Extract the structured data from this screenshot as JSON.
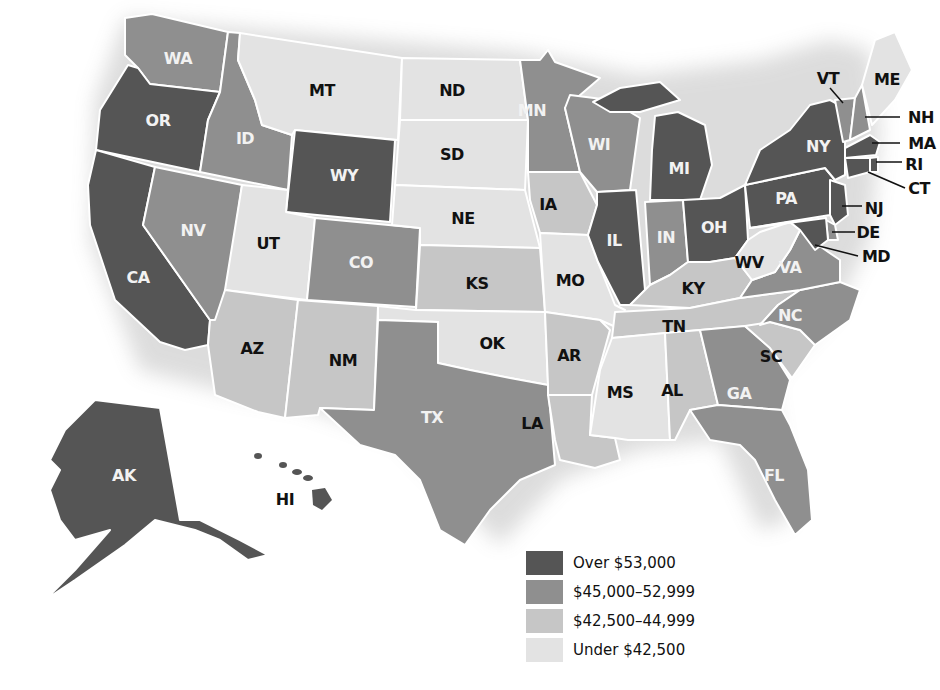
{
  "title": "",
  "colors": {
    "over_53000": "#555555",
    "45000_52999": "#8f8f8f",
    "42500_44999": "#c6c6c6",
    "under_42500": "#e3e3e3"
  },
  "legend": {
    "items": [
      {
        "label": "Over $53,000",
        "color": "#555555"
      },
      {
        "label": "$45,000–52,999",
        "color": "#8f8f8f"
      },
      {
        "label": "$42,500–44,999",
        "color": "#c6c6c6"
      },
      {
        "label": "Under $42,500",
        "color": "#e3e3e3"
      }
    ]
  },
  "states": {
    "WA": {
      "label": "WA",
      "category": "$45,000–52,999"
    },
    "OR": {
      "label": "OR",
      "category": "Over $53,000"
    },
    "CA": {
      "label": "CA",
      "category": "Over $53,000"
    },
    "ID": {
      "label": "ID",
      "category": "$45,000–52,999"
    },
    "NV": {
      "label": "NV",
      "category": "$45,000–52,999"
    },
    "MT": {
      "label": "MT",
      "category": "Under $42,500"
    },
    "WY": {
      "label": "WY",
      "category": "Over $53,000"
    },
    "UT": {
      "label": "UT",
      "category": "Under $42,500"
    },
    "CO": {
      "label": "CO",
      "category": "$45,000–52,999"
    },
    "AZ": {
      "label": "AZ",
      "category": "$42,500–44,999"
    },
    "NM": {
      "label": "NM",
      "category": "$42,500–44,999"
    },
    "ND": {
      "label": "ND",
      "category": "Under $42,500"
    },
    "SD": {
      "label": "SD",
      "category": "Under $42,500"
    },
    "NE": {
      "label": "NE",
      "category": "Under $42,500"
    },
    "KS": {
      "label": "KS",
      "category": "$42,500–44,999"
    },
    "OK": {
      "label": "OK",
      "category": "Under $42,500"
    },
    "TX": {
      "label": "TX",
      "category": "$45,000–52,999"
    },
    "MN": {
      "label": "MN",
      "category": "$45,000–52,999"
    },
    "IA": {
      "label": "IA",
      "category": "$42,500–44,999"
    },
    "MO": {
      "label": "MO",
      "category": "Under $42,500"
    },
    "AR": {
      "label": "AR",
      "category": "$42,500–44,999"
    },
    "LA": {
      "label": "LA",
      "category": "$42,500–44,999"
    },
    "WI": {
      "label": "WI",
      "category": "$45,000–52,999"
    },
    "IL": {
      "label": "IL",
      "category": "Over $53,000"
    },
    "MI": {
      "label": "MI",
      "category": "Over $53,000"
    },
    "IN": {
      "label": "IN",
      "category": "$45,000–52,999"
    },
    "OH": {
      "label": "OH",
      "category": "Over $53,000"
    },
    "KY": {
      "label": "KY",
      "category": "$42,500–44,999"
    },
    "TN": {
      "label": "TN",
      "category": "$42,500–44,999"
    },
    "MS": {
      "label": "MS",
      "category": "Under $42,500"
    },
    "AL": {
      "label": "AL",
      "category": "$42,500–44,999"
    },
    "GA": {
      "label": "GA",
      "category": "$45,000–52,999"
    },
    "FL": {
      "label": "FL",
      "category": "$45,000–52,999"
    },
    "SC": {
      "label": "SC",
      "category": "$42,500–44,999"
    },
    "NC": {
      "label": "NC",
      "category": "$45,000–52,999"
    },
    "VA": {
      "label": "VA",
      "category": "$45,000–52,999"
    },
    "WV": {
      "label": "WV",
      "category": "Under $42,500"
    },
    "PA": {
      "label": "PA",
      "category": "Over $53,000"
    },
    "NY": {
      "label": "NY",
      "category": "Over $53,000"
    },
    "VT": {
      "label": "VT",
      "category": "$45,000–52,999"
    },
    "NH": {
      "label": "NH",
      "category": "$45,000–52,999"
    },
    "ME": {
      "label": "ME",
      "category": "Under $42,500"
    },
    "MA": {
      "label": "MA",
      "category": "Over $53,000"
    },
    "RI": {
      "label": "RI",
      "category": "Over $53,000"
    },
    "CT": {
      "label": "CT",
      "category": "Over $53,000"
    },
    "NJ": {
      "label": "NJ",
      "category": "Over $53,000"
    },
    "DE": {
      "label": "DE",
      "category": "$45,000–52,999"
    },
    "MD": {
      "label": "MD",
      "category": "Over $53,000"
    },
    "AK": {
      "label": "AK",
      "category": "Over $53,000"
    },
    "HI": {
      "label": "HI",
      "category": "Over $53,000"
    }
  }
}
